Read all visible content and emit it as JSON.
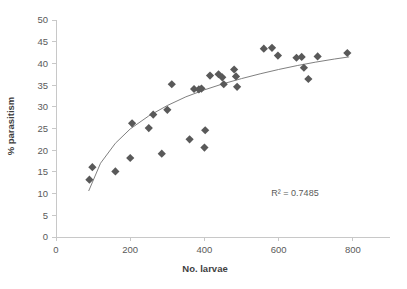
{
  "chart_data": {
    "type": "scatter",
    "title": "",
    "xlabel": "No. larvae",
    "ylabel": "% parasitism",
    "xlim": [
      0,
      900
    ],
    "ylim": [
      0,
      50
    ],
    "xticks": [
      0,
      200,
      400,
      600,
      800
    ],
    "yticks": [
      0,
      5,
      10,
      15,
      20,
      25,
      30,
      35,
      40,
      45,
      50
    ],
    "xtick_labels": [
      "0",
      "200",
      "400",
      "600",
      "800"
    ],
    "ytick_labels": [
      "0",
      "5",
      "10",
      "15",
      "20",
      "25",
      "30",
      "35",
      "40",
      "45",
      "50"
    ],
    "grid": false,
    "legend": false,
    "marker_shape": "diamond",
    "marker_color": "#595959",
    "trendline": {
      "present": true,
      "type": "logarithmic",
      "color": "#808080",
      "r_squared": 0.7485,
      "annotation": "R² = 0.7485"
    },
    "points": [
      {
        "x": 90,
        "y": 13.2
      },
      {
        "x": 98,
        "y": 16.1
      },
      {
        "x": 160,
        "y": 15.1
      },
      {
        "x": 200,
        "y": 18.2
      },
      {
        "x": 205,
        "y": 26.2
      },
      {
        "x": 250,
        "y": 25.1
      },
      {
        "x": 262,
        "y": 28.2
      },
      {
        "x": 285,
        "y": 19.2
      },
      {
        "x": 300,
        "y": 29.3
      },
      {
        "x": 312,
        "y": 35.2
      },
      {
        "x": 360,
        "y": 22.5
      },
      {
        "x": 372,
        "y": 34.1
      },
      {
        "x": 385,
        "y": 34.0
      },
      {
        "x": 392,
        "y": 34.2
      },
      {
        "x": 400,
        "y": 20.6
      },
      {
        "x": 402,
        "y": 24.6
      },
      {
        "x": 415,
        "y": 37.2
      },
      {
        "x": 438,
        "y": 37.5
      },
      {
        "x": 448,
        "y": 36.8
      },
      {
        "x": 452,
        "y": 35.2
      },
      {
        "x": 480,
        "y": 38.6
      },
      {
        "x": 485,
        "y": 37.0
      },
      {
        "x": 488,
        "y": 34.6
      },
      {
        "x": 560,
        "y": 43.4
      },
      {
        "x": 582,
        "y": 43.6
      },
      {
        "x": 598,
        "y": 41.8
      },
      {
        "x": 648,
        "y": 41.3
      },
      {
        "x": 662,
        "y": 41.5
      },
      {
        "x": 668,
        "y": 39.0
      },
      {
        "x": 680,
        "y": 36.4
      },
      {
        "x": 705,
        "y": 41.6
      },
      {
        "x": 785,
        "y": 42.4
      }
    ],
    "trend_points": [
      {
        "x": 88,
        "y": 10.6
      },
      {
        "x": 120,
        "y": 17.0
      },
      {
        "x": 160,
        "y": 21.6
      },
      {
        "x": 200,
        "y": 24.9
      },
      {
        "x": 250,
        "y": 27.9
      },
      {
        "x": 300,
        "y": 30.3
      },
      {
        "x": 350,
        "y": 32.3
      },
      {
        "x": 400,
        "y": 33.9
      },
      {
        "x": 450,
        "y": 35.3
      },
      {
        "x": 500,
        "y": 36.5
      },
      {
        "x": 550,
        "y": 37.6
      },
      {
        "x": 600,
        "y": 38.6
      },
      {
        "x": 650,
        "y": 39.5
      },
      {
        "x": 700,
        "y": 40.3
      },
      {
        "x": 750,
        "y": 41.0
      },
      {
        "x": 790,
        "y": 41.5
      }
    ]
  }
}
